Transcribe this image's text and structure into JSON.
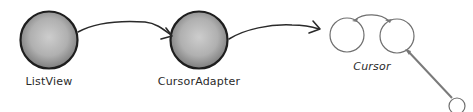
{
  "diagram": {
    "nodes": [
      {
        "id": "listview",
        "label": "ListView",
        "shape": "shaded-circle"
      },
      {
        "id": "cursoradapter",
        "label": "CursorAdapter",
        "shape": "shaded-circle"
      },
      {
        "id": "cursor",
        "label": "Cursor",
        "shape": "lorgnette-glasses"
      }
    ],
    "edges": [
      {
        "from": "listview",
        "to": "cursoradapter",
        "style": "curved-arrow"
      },
      {
        "from": "cursoradapter",
        "to": "cursor",
        "style": "curved-arrow"
      }
    ],
    "colors": {
      "node_fill_center": "#c8c8c8",
      "node_fill_edge": "#8a8a8a",
      "node_stroke": "#1e1e1e",
      "arrow": "#2a2a2a",
      "glasses_stroke": "#777777",
      "text": "#2a2a2a"
    }
  }
}
